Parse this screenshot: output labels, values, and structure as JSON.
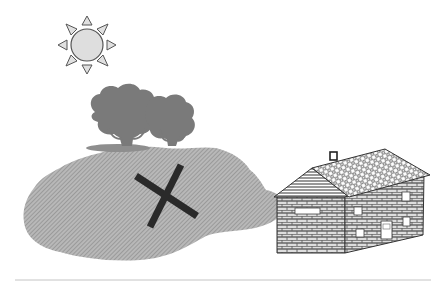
{
  "scene": {
    "title": "Landscape with sun, trees, hill marked with X, and brick house",
    "background": "#ffffff"
  },
  "sun": {
    "label": "Sun",
    "icon": "sun-icon",
    "center": [
      87,
      45
    ],
    "radius": 17,
    "ray_count": 8,
    "fill": "#dcdcdc",
    "stroke": "#555555"
  },
  "trees": {
    "label": "Trees",
    "icon": "tree-icon",
    "count": 2,
    "fill": "#7a7a7a"
  },
  "hill": {
    "label": "Hatched ground area",
    "fill": "#9a9a9a",
    "hatch": "diagonal"
  },
  "marker": {
    "label": "X mark",
    "icon": "x-mark-icon",
    "center": [
      165,
      198
    ],
    "color": "#2a2a2a"
  },
  "house": {
    "label": "Brick house",
    "icon": "house-icon",
    "roof_pattern": "tiles",
    "wall_pattern": "bricks",
    "windows": 5,
    "doors": 1,
    "chimney": true
  },
  "ground_line": {
    "label": "Baseline",
    "y": 280,
    "color": "#bdbdbd"
  }
}
